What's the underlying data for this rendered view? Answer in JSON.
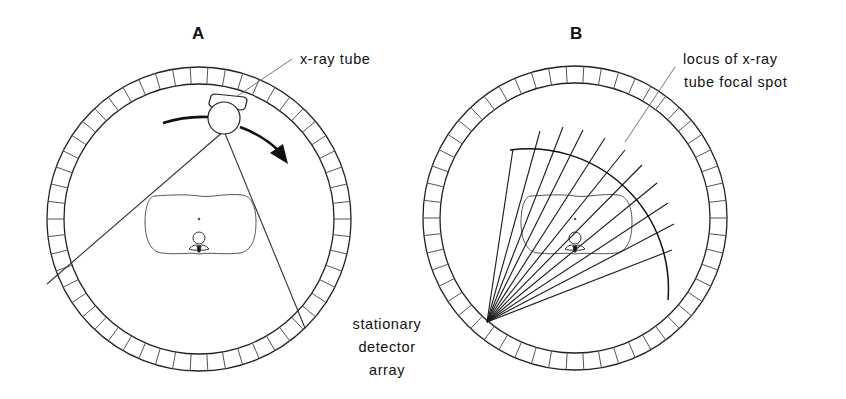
{
  "panels": [
    {
      "id": "A",
      "letter": "A",
      "labels": {
        "tube": "x-ray tube"
      },
      "detector_ring": {
        "cx": 199,
        "cy": 219,
        "outer_r": 152,
        "inner_r": 135,
        "segments": 54
      },
      "tube": {
        "cx": 224,
        "cy": 115,
        "r": 16
      },
      "beam": {
        "apex": [
          224,
          131
        ],
        "left_end": [
          47,
          284
        ],
        "right_end": [
          305,
          328
        ]
      }
    },
    {
      "id": "B",
      "letter": "B",
      "labels": {
        "locus_line1": "locus of x-ray",
        "locus_line2": "tube focal spot"
      },
      "detector_ring": {
        "cx": 575,
        "cy": 218,
        "outer_r": 152,
        "inner_r": 135,
        "segments": 54
      },
      "fan": {
        "apex": [
          487,
          322
        ],
        "ray_count": 11
      }
    }
  ],
  "shared_label": {
    "line1": "stationary",
    "line2": "detector",
    "line3": "array"
  },
  "colors": {
    "stroke": "#222222",
    "light_stroke": "#555555",
    "background": "#ffffff"
  }
}
